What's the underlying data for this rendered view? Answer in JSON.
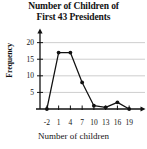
{
  "chart_data": {
    "type": "line",
    "title": "Number of Children of First 43 Presidents",
    "title_line1": "Number of Children of",
    "title_line2": "First 43 Presidents",
    "xlabel": "Number of children",
    "ylabel": "Frequency",
    "x": [
      -2,
      1,
      4,
      7,
      10,
      13,
      16,
      19
    ],
    "values": [
      0,
      17,
      17,
      8,
      1,
      0.5,
      2,
      0
    ],
    "xticks": [
      -2,
      1,
      4,
      7,
      10,
      13,
      16,
      19
    ],
    "yticks": [
      5,
      10,
      15,
      20
    ],
    "xlim": [
      -3.5,
      21
    ],
    "ylim": [
      0,
      22
    ],
    "grid": "horizontal",
    "legend": "none",
    "marker": "filled-circle",
    "line_color": "#111111",
    "grid_color": "#b9b9b9",
    "axis_color": "#111111"
  }
}
